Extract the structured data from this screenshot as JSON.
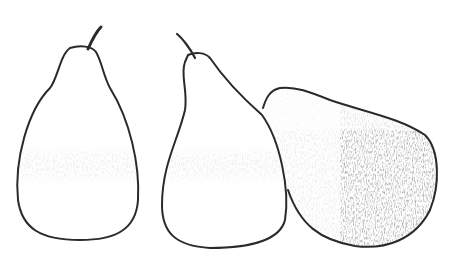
{
  "scene": {
    "description": "Pencil sketch of three pears side by side with shaded lower halves",
    "background_color": "#ffffff",
    "line_color": "#2a2a2a",
    "shade_color": "#555555",
    "objects": [
      {
        "name": "left-pear",
        "orientation": "upright"
      },
      {
        "name": "middle-pear",
        "orientation": "upright"
      },
      {
        "name": "right-pear",
        "orientation": "lying on side"
      }
    ]
  }
}
